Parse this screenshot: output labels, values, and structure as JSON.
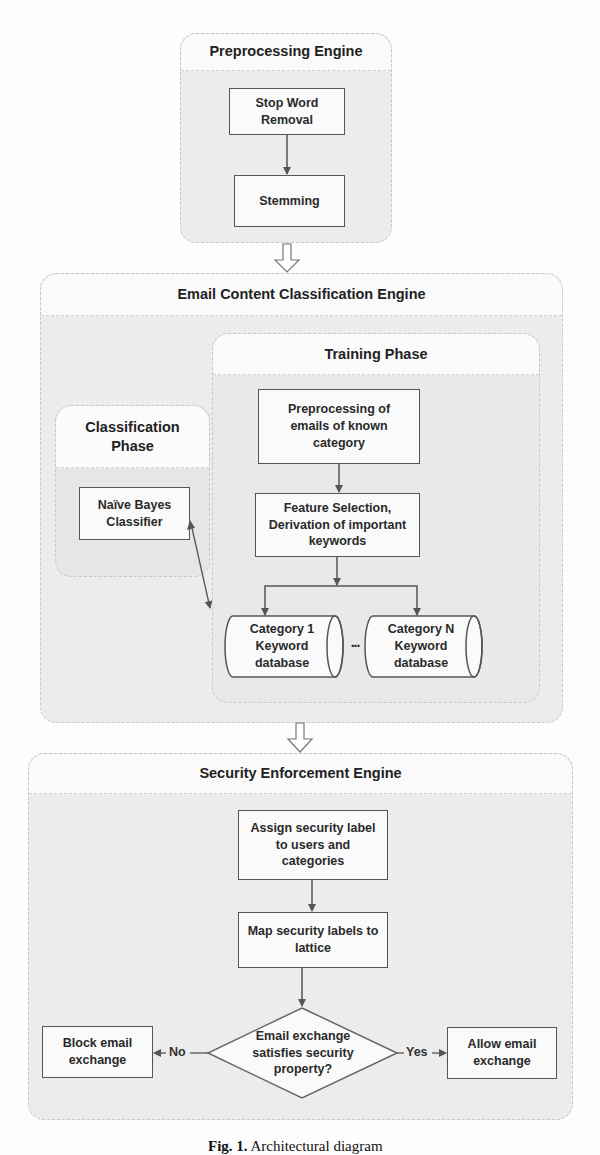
{
  "diagram": {
    "preprocessing_engine": {
      "title": "Preprocessing Engine",
      "steps": [
        "Stop Word Removal",
        "Stemming"
      ]
    },
    "email_content_classification_engine": {
      "title": "Email Content Classification Engine",
      "classification_phase": {
        "title": "Classification Phase",
        "classifier": "Naïve Bayes Classifier"
      },
      "training_phase": {
        "title": "Training Phase",
        "steps": [
          "Preprocessing of emails of known category",
          "Feature Selection, Derivation of important keywords"
        ],
        "databases": [
          "Category 1 Keyword database",
          "Category N Keyword database"
        ],
        "ellipsis": "..."
      }
    },
    "security_enforcement_engine": {
      "title": "Security Enforcement Engine",
      "steps": [
        "Assign security label to users and categories",
        "Map security labels to lattice"
      ],
      "decision": "Email exchange satisfies security property?",
      "no_label": "No",
      "yes_label": "Yes",
      "no_outcome": "Block email exchange",
      "yes_outcome": "Allow email exchange"
    },
    "caption": {
      "prefix": "Fig. 1.",
      "text": "Architectural diagram"
    }
  }
}
